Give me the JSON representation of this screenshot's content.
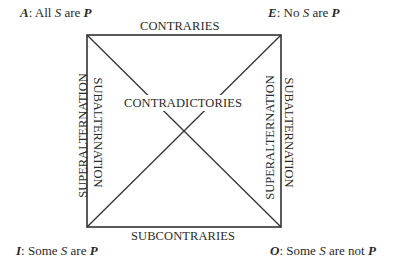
{
  "corners": {
    "A": {
      "letter": "A",
      "sep": ": ",
      "pre": "All ",
      "S": "S",
      "mid": " are ",
      "P": "P",
      "post": ""
    },
    "E": {
      "letter": "E",
      "sep": ": ",
      "pre": "No ",
      "S": "S",
      "mid": " are ",
      "P": "P",
      "post": ""
    },
    "I": {
      "letter": "I",
      "sep": ": ",
      "pre": "Some ",
      "S": "S",
      "mid": " are ",
      "P": "P",
      "post": ""
    },
    "O": {
      "letter": "O",
      "sep": ": ",
      "pre": "Some ",
      "S": "S",
      "mid": " are not ",
      "P": "P",
      "post": ""
    }
  },
  "relations": {
    "top": "CONTRARIES",
    "bottom": "SUBCONTRARIES",
    "center": "CONTRADICTORIES",
    "left_outer": "SUPERALTERNATION",
    "left_inner": "SUBALTERNATION",
    "right_inner": "SUPERALTERNATION",
    "right_outer": "SUBALTERNATION"
  },
  "colors": {
    "line": "#333333",
    "text": "#2a2a2a",
    "background": "#ffffff"
  }
}
